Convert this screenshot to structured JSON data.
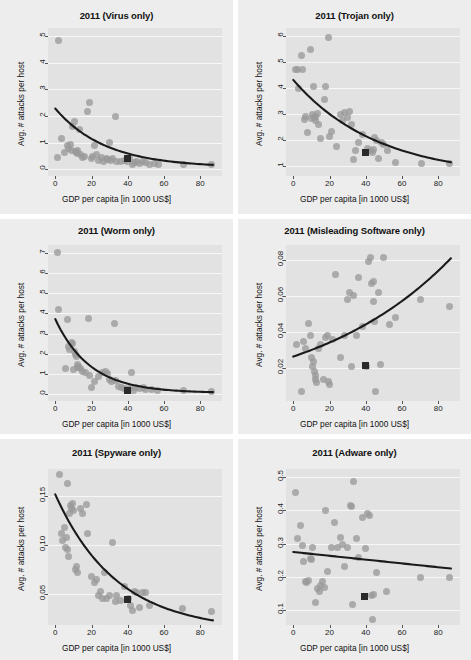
{
  "figure": {
    "kind": "faceted-scatter-grid",
    "rows": 3,
    "cols": 2,
    "panel_background": "#ededed",
    "plot_background": "#e2e2e2",
    "gridline_color": "#f7f7f7",
    "point_color": "#9a9a9a",
    "highlight_marker_color": "#2a2a2a",
    "fit_line_color": "#1a1a1a"
  },
  "common": {
    "xlabel": "GDP per capita [in 1000 US$]",
    "ylabel": "Avg. # attacks per host",
    "xticks": [
      "0",
      "20",
      "40",
      "60",
      "80"
    ],
    "xlim": [
      -4,
      92
    ]
  },
  "chart_data": [
    {
      "type": "scatter",
      "title": "2011 (Virus only)",
      "xlabel": "GDP per capita [in 1000 US$]",
      "ylabel": "Avg. # attacks per host",
      "xlim": [
        -4,
        92
      ],
      "ylim": [
        -0.25,
        5.3
      ],
      "xticks": [
        0,
        20,
        40,
        60,
        80
      ],
      "yticks": [
        0,
        1,
        2,
        3,
        4,
        5
      ],
      "grid": true,
      "legend": "none",
      "points": [
        [
          2.0,
          4.85
        ],
        [
          1.2,
          0.45
        ],
        [
          3.5,
          1.15
        ],
        [
          5.0,
          0.62
        ],
        [
          6.5,
          0.9
        ],
        [
          7.5,
          0.78
        ],
        [
          8.5,
          0.95
        ],
        [
          9.0,
          0.72
        ],
        [
          9.5,
          1.62
        ],
        [
          10.5,
          1.8
        ],
        [
          11.0,
          0.68
        ],
        [
          11.5,
          0.62
        ],
        [
          12.0,
          0.72
        ],
        [
          12.5,
          0.6
        ],
        [
          13.5,
          1.5
        ],
        [
          14.0,
          0.55
        ],
        [
          15.0,
          0.45
        ],
        [
          16.0,
          0.48
        ],
        [
          18.0,
          2.18
        ],
        [
          19.0,
          2.52
        ],
        [
          20.0,
          0.42
        ],
        [
          20.5,
          0.5
        ],
        [
          21.5,
          0.9
        ],
        [
          23.0,
          0.55
        ],
        [
          24.0,
          0.35
        ],
        [
          25.5,
          0.45
        ],
        [
          26.5,
          0.3
        ],
        [
          28.0,
          0.42
        ],
        [
          29.0,
          0.38
        ],
        [
          30.0,
          1.0
        ],
        [
          30.5,
          0.35
        ],
        [
          31.5,
          0.42
        ],
        [
          33.5,
          1.98
        ],
        [
          34.0,
          0.3
        ],
        [
          36.0,
          0.28
        ],
        [
          38.0,
          0.35
        ],
        [
          40.0,
          0.3
        ],
        [
          41.0,
          0.42
        ],
        [
          42.5,
          0.2
        ],
        [
          43.5,
          0.25
        ],
        [
          45.0,
          0.3
        ],
        [
          46.5,
          0.22
        ],
        [
          48.0,
          0.3
        ],
        [
          50.0,
          0.25
        ],
        [
          52.0,
          0.2
        ],
        [
          55.0,
          0.22
        ],
        [
          57.0,
          0.18
        ],
        [
          70.5,
          0.2
        ],
        [
          86.0,
          0.2
        ]
      ],
      "highlight_point": [
        40.0,
        0.4
      ],
      "fit": {
        "kind": "exp-decay",
        "y0": 2.28,
        "yinf": 0.07,
        "rate": 0.036
      }
    },
    {
      "type": "scatter",
      "title": "2011 (Trojan only)",
      "xlabel": "GDP per capita [in 1000 US$]",
      "ylabel": "Avg. # attacks per host",
      "xlim": [
        -4,
        92
      ],
      "ylim": [
        0.6,
        6.3
      ],
      "xticks": [
        0,
        20,
        40,
        60,
        80
      ],
      "yticks": [
        1,
        2,
        3,
        4,
        5,
        6
      ],
      "grid": true,
      "legend": "none",
      "points": [
        [
          1.5,
          4.72
        ],
        [
          2.5,
          4.72
        ],
        [
          3.0,
          3.98
        ],
        [
          4.5,
          5.25
        ],
        [
          5.0,
          4.72
        ],
        [
          6.0,
          2.78
        ],
        [
          7.0,
          2.9
        ],
        [
          8.0,
          2.28
        ],
        [
          9.5,
          5.48
        ],
        [
          10.0,
          2.82
        ],
        [
          10.5,
          2.95
        ],
        [
          11.0,
          4.05
        ],
        [
          11.5,
          2.85
        ],
        [
          12.0,
          2.9
        ],
        [
          12.5,
          2.72
        ],
        [
          13.5,
          3.02
        ],
        [
          14.0,
          2.6
        ],
        [
          15.0,
          2.05
        ],
        [
          17.0,
          3.55
        ],
        [
          18.0,
          4.05
        ],
        [
          19.5,
          5.92
        ],
        [
          20.0,
          2.12
        ],
        [
          21.0,
          2.3
        ],
        [
          24.0,
          1.72
        ],
        [
          26.0,
          2.95
        ],
        [
          27.0,
          2.72
        ],
        [
          28.0,
          3.05
        ],
        [
          30.0,
          2.85
        ],
        [
          31.0,
          3.08
        ],
        [
          32.0,
          2.6
        ],
        [
          33.0,
          1.25
        ],
        [
          34.5,
          1.58
        ],
        [
          36.0,
          1.9
        ],
        [
          38.0,
          2.2
        ],
        [
          41.0,
          1.65
        ],
        [
          42.5,
          1.58
        ],
        [
          43.5,
          1.52
        ],
        [
          44.5,
          1.62
        ],
        [
          45.0,
          2.08
        ],
        [
          46.0,
          1.95
        ],
        [
          47.0,
          1.28
        ],
        [
          48.5,
          1.88
        ],
        [
          50.0,
          1.82
        ],
        [
          52.0,
          1.58
        ],
        [
          56.5,
          1.12
        ],
        [
          70.5,
          1.1
        ],
        [
          86.0,
          1.08
        ]
      ],
      "highlight_point": [
        40.0,
        1.52
      ],
      "fit": {
        "kind": "exp-decay",
        "y0": 4.3,
        "yinf": 0.55,
        "rate": 0.0215
      }
    },
    {
      "type": "scatter",
      "title": "2011 (Worm only)",
      "xlabel": "GDP per capita [in 1000 US$]",
      "ylabel": "Avg. # attacks per host",
      "xlim": [
        -4,
        92
      ],
      "ylim": [
        -0.35,
        7.4
      ],
      "xticks": [
        0,
        20,
        40,
        60,
        80
      ],
      "yticks": [
        0,
        1,
        2,
        3,
        4,
        5,
        6,
        7
      ],
      "grid": true,
      "legend": "none",
      "points": [
        [
          1.5,
          7.05
        ],
        [
          2.0,
          4.2
        ],
        [
          5.5,
          1.28
        ],
        [
          6.5,
          3.72
        ],
        [
          7.5,
          2.35
        ],
        [
          8.0,
          2.22
        ],
        [
          9.0,
          2.55
        ],
        [
          9.5,
          2.5
        ],
        [
          10.0,
          1.22
        ],
        [
          10.5,
          2.1
        ],
        [
          11.0,
          1.95
        ],
        [
          11.5,
          1.85
        ],
        [
          12.0,
          1.3
        ],
        [
          12.5,
          1.48
        ],
        [
          13.0,
          1.35
        ],
        [
          14.0,
          1.28
        ],
        [
          15.0,
          1.1
        ],
        [
          16.5,
          1.05
        ],
        [
          18.5,
          3.75
        ],
        [
          19.0,
          0.9
        ],
        [
          20.0,
          0.32
        ],
        [
          21.5,
          0.62
        ],
        [
          24.0,
          0.85
        ],
        [
          26.0,
          1.05
        ],
        [
          27.5,
          1.12
        ],
        [
          29.0,
          1.02
        ],
        [
          30.0,
          0.72
        ],
        [
          31.0,
          0.6
        ],
        [
          32.5,
          3.48
        ],
        [
          33.5,
          0.65
        ],
        [
          35.0,
          0.35
        ],
        [
          36.5,
          0.3
        ],
        [
          38.0,
          0.28
        ],
        [
          40.0,
          0.2
        ],
        [
          41.0,
          0.25
        ],
        [
          42.0,
          1.05
        ],
        [
          43.0,
          0.18
        ],
        [
          44.5,
          0.3
        ],
        [
          46.5,
          0.25
        ],
        [
          48.5,
          0.3
        ],
        [
          50.0,
          0.22
        ],
        [
          53.0,
          0.2
        ],
        [
          56.5,
          0.15
        ],
        [
          70.5,
          0.18
        ],
        [
          86.0,
          0.12
        ]
      ],
      "highlight_point": [
        40.0,
        0.15
      ],
      "fit": {
        "kind": "exp-decay",
        "y0": 3.72,
        "yinf": 0.05,
        "rate": 0.052
      }
    },
    {
      "type": "scatter",
      "title": "2011 (Misleading Software only)",
      "xlabel": "GDP per capita [in 1000 US$]",
      "ylabel": "Avg. # attacks per host",
      "xlim": [
        -4,
        92
      ],
      "ylim": [
        0.002,
        0.088
      ],
      "xticks": [
        0,
        20,
        40,
        60,
        80
      ],
      "yticks": [
        0.02,
        0.04,
        0.06,
        0.08
      ],
      "grid": true,
      "legend": "none",
      "points": [
        [
          2.0,
          0.033
        ],
        [
          4.5,
          0.007
        ],
        [
          5.5,
          0.035
        ],
        [
          7.0,
          0.031
        ],
        [
          8.5,
          0.045
        ],
        [
          9.5,
          0.038
        ],
        [
          10.0,
          0.026
        ],
        [
          10.5,
          0.021
        ],
        [
          11.0,
          0.024
        ],
        [
          11.5,
          0.018
        ],
        [
          12.0,
          0.014
        ],
        [
          12.5,
          0.016
        ],
        [
          13.0,
          0.012
        ],
        [
          14.0,
          0.031
        ],
        [
          15.0,
          0.033
        ],
        [
          16.5,
          0.014
        ],
        [
          18.0,
          0.037
        ],
        [
          19.0,
          0.038
        ],
        [
          19.5,
          0.013
        ],
        [
          20.0,
          0.011
        ],
        [
          21.5,
          0.036
        ],
        [
          23.5,
          0.072
        ],
        [
          26.0,
          0.026
        ],
        [
          28.0,
          0.038
        ],
        [
          30.0,
          0.058
        ],
        [
          31.0,
          0.062
        ],
        [
          32.0,
          0.021
        ],
        [
          33.5,
          0.06
        ],
        [
          35.0,
          0.038
        ],
        [
          36.0,
          0.07
        ],
        [
          38.0,
          0.043
        ],
        [
          40.5,
          0.021
        ],
        [
          41.5,
          0.079
        ],
        [
          42.5,
          0.081
        ],
        [
          43.0,
          0.067
        ],
        [
          44.0,
          0.068
        ],
        [
          44.5,
          0.057
        ],
        [
          45.0,
          0.046
        ],
        [
          45.5,
          0.007
        ],
        [
          47.0,
          0.062
        ],
        [
          48.0,
          0.022
        ],
        [
          50.0,
          0.081
        ],
        [
          53.0,
          0.044
        ],
        [
          56.5,
          0.048
        ],
        [
          70.0,
          0.058
        ],
        [
          86.0,
          0.054
        ]
      ],
      "highlight_point": [
        40.0,
        0.0215
      ],
      "fit": {
        "kind": "exp-growth",
        "y0": 0.0265,
        "rate": 0.0128
      }
    },
    {
      "type": "scatter",
      "title": "2011 (Spyware only)",
      "xlabel": "GDP per capita [in 1000 US$]",
      "ylabel": "Avg. # attacks per host",
      "xlim": [
        -4,
        92
      ],
      "ylim": [
        0.018,
        0.178
      ],
      "xticks": [
        0,
        20,
        40,
        60,
        80
      ],
      "yticks": [
        0.05,
        0.1,
        0.15
      ],
      "grid": true,
      "legend": "none",
      "points": [
        [
          2.5,
          0.172
        ],
        [
          3.5,
          0.112
        ],
        [
          4.0,
          0.105
        ],
        [
          5.0,
          0.118
        ],
        [
          5.5,
          0.098
        ],
        [
          6.0,
          0.108
        ],
        [
          6.5,
          0.095
        ],
        [
          7.0,
          0.163
        ],
        [
          7.5,
          0.088
        ],
        [
          8.0,
          0.132
        ],
        [
          8.5,
          0.141
        ],
        [
          9.0,
          0.138
        ],
        [
          9.5,
          0.143
        ],
        [
          10.0,
          0.135
        ],
        [
          11.0,
          0.075
        ],
        [
          11.5,
          0.078
        ],
        [
          12.0,
          0.072
        ],
        [
          14.0,
          0.138
        ],
        [
          15.0,
          0.132
        ],
        [
          17.0,
          0.142
        ],
        [
          18.0,
          0.112
        ],
        [
          20.0,
          0.068
        ],
        [
          21.5,
          0.062
        ],
        [
          23.0,
          0.065
        ],
        [
          24.0,
          0.048
        ],
        [
          25.0,
          0.052
        ],
        [
          26.0,
          0.045
        ],
        [
          27.0,
          0.072
        ],
        [
          28.5,
          0.045
        ],
        [
          30.0,
          0.048
        ],
        [
          31.5,
          0.103
        ],
        [
          33.0,
          0.042
        ],
        [
          34.0,
          0.048
        ],
        [
          36.0,
          0.043
        ],
        [
          38.0,
          0.058
        ],
        [
          40.5,
          0.045
        ],
        [
          41.5,
          0.038
        ],
        [
          42.5,
          0.033
        ],
        [
          43.5,
          0.052
        ],
        [
          45.0,
          0.051
        ],
        [
          46.5,
          0.036
        ],
        [
          48.0,
          0.051
        ],
        [
          50.0,
          0.051
        ],
        [
          52.0,
          0.038
        ],
        [
          70.0,
          0.035
        ],
        [
          86.0,
          0.032
        ]
      ],
      "highlight_point": [
        40.0,
        0.044
      ],
      "fit": {
        "kind": "exp-decay",
        "y0": 0.152,
        "yinf": 0.012,
        "rate": 0.0295
      }
    },
    {
      "type": "scatter",
      "title": "2011 (Adware only)",
      "xlabel": "GDP per capita [in 1000 US$]",
      "ylabel": "Avg. # attacks per host",
      "xlim": [
        -4,
        92
      ],
      "ylim": [
        0.055,
        0.525
      ],
      "xticks": [
        0,
        20,
        40,
        60,
        80
      ],
      "yticks": [
        0.1,
        0.2,
        0.3,
        0.4,
        0.5
      ],
      "grid": true,
      "legend": "none",
      "points": [
        [
          1.5,
          0.455
        ],
        [
          2.5,
          0.315
        ],
        [
          4.0,
          0.355
        ],
        [
          5.0,
          0.295
        ],
        [
          5.5,
          0.245
        ],
        [
          7.0,
          0.185
        ],
        [
          7.5,
          0.182
        ],
        [
          8.5,
          0.19
        ],
        [
          9.5,
          0.255
        ],
        [
          10.0,
          0.252
        ],
        [
          10.5,
          0.29
        ],
        [
          12.0,
          0.122
        ],
        [
          13.5,
          0.165
        ],
        [
          14.5,
          0.155
        ],
        [
          15.0,
          0.175
        ],
        [
          16.0,
          0.185
        ],
        [
          17.0,
          0.168
        ],
        [
          18.0,
          0.4
        ],
        [
          19.0,
          0.215
        ],
        [
          21.0,
          0.288
        ],
        [
          23.0,
          0.365
        ],
        [
          24.5,
          0.29
        ],
        [
          26.0,
          0.318
        ],
        [
          27.0,
          0.298
        ],
        [
          28.5,
          0.232
        ],
        [
          30.0,
          0.29
        ],
        [
          31.5,
          0.415
        ],
        [
          32.0,
          0.412
        ],
        [
          32.5,
          0.118
        ],
        [
          33.0,
          0.488
        ],
        [
          35.0,
          0.315
        ],
        [
          36.0,
          0.258
        ],
        [
          38.0,
          0.378
        ],
        [
          40.0,
          0.285
        ],
        [
          41.0,
          0.392
        ],
        [
          42.0,
          0.385
        ],
        [
          43.0,
          0.145
        ],
        [
          43.5,
          0.072
        ],
        [
          44.5,
          0.148
        ],
        [
          46.0,
          0.212
        ],
        [
          51.5,
          0.155
        ],
        [
          70.0,
          0.198
        ],
        [
          86.0,
          0.198
        ]
      ],
      "highlight_point": [
        39.5,
        0.142
      ],
      "fit": {
        "kind": "linear",
        "y_at_xmin": 0.275,
        "y_at_xmax": 0.225
      }
    }
  ]
}
